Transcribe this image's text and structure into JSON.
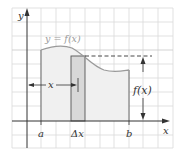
{
  "figure": {
    "axes": {
      "x_label": "x",
      "y_label": "y"
    },
    "curve_label": "y = f(x)",
    "ticks": {
      "a": "a",
      "delta_x": "Δx",
      "b": "b"
    },
    "annotations": {
      "x_bracket": "x",
      "height_label": "f(x)"
    },
    "colors": {
      "grid": "#d9d9d9",
      "axis": "#333333",
      "curve": "#9a9a9a",
      "region_fill": "#f0f0f0",
      "strip_fill": "#d8d8d8",
      "outline": "#555555"
    }
  }
}
